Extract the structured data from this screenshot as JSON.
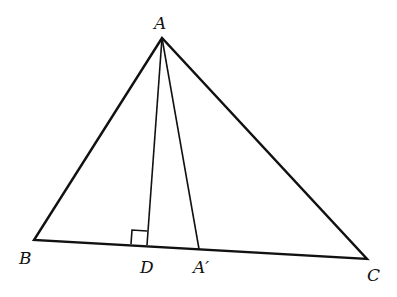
{
  "diagram": {
    "type": "triangle",
    "vertices": {
      "A": {
        "label": "A",
        "x": 162,
        "y": 38
      },
      "B": {
        "label": "B",
        "x": 34,
        "y": 240
      },
      "C": {
        "label": "C",
        "x": 367,
        "y": 259
      }
    },
    "points": {
      "D": {
        "label": "D",
        "x": 147,
        "y": 245
      },
      "A_prime": {
        "label": "A′",
        "x": 199,
        "y": 249
      }
    },
    "segments": [
      "AB",
      "BC",
      "CA",
      "AD",
      "AA′"
    ],
    "annotations": [
      "right angle at D (AD ⟂ BC)"
    ],
    "stroke_color": "#111111"
  }
}
